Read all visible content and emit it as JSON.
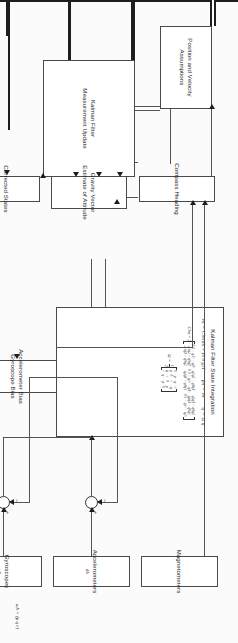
{
  "figure": {
    "type": "block-diagram",
    "orientation_note": "landscape figure printed rotated 90 degrees on a portrait page"
  },
  "blocks": {
    "position_velocity": {
      "line1": "Position and Velocity",
      "line2": "Assumptions"
    },
    "kf_measurement_update": {
      "line1": "Kalman Filter",
      "line2": "Measurement Update"
    },
    "compass_heading": {
      "line1": "Compass Heading"
    },
    "gravity_vector": {
      "line1": "Gravity Vector",
      "line2": "Estimate of Attitude"
    },
    "corrected_states": {
      "line1": "Corrected States"
    },
    "bias": {
      "line1": "Accelerometer Bias",
      "line2": "Gyroscope Bias"
    },
    "magnetometers": {
      "line1": "Magnetometers"
    },
    "accelerometers": {
      "line1": "Accelerometers",
      "symbol": "ãb"
    },
    "gyroscopes": {
      "line1": "Gyroscopes",
      "symbol": "ω̃b"
    },
    "state_integration": {
      "title": "Kalman Filter State Integration",
      "eq1_lhs": "v̇n",
      "eq1_rhs": "Cbn ãb + [0 0 g]T",
      "eq2_lhs": "ṗn",
      "eq2_rhs": "vn",
      "eq3_lhs": "q̇",
      "eq3_rhs": "Ω q",
      "dcm_label": "Cbn = 2",
      "dcm": [
        [
          "0.5 − q2² − q3²",
          "q1q2 − q0q3",
          "q1q3 + q0q2"
        ],
        [
          "q1q2 + q0q3",
          "0.5 − q1² − q3²",
          "q2q3 − q0q1"
        ],
        [
          "q1q3 − q0q2",
          "q2q3 + q0q1",
          "0.5 − q1² − q2²"
        ]
      ],
      "omega_label": "Ω =",
      "omega_coef_num": "1",
      "omega_coef_den": "2",
      "omega": [
        [
          "0",
          "−p",
          "−q",
          "−r"
        ],
        [
          "p",
          "0",
          "r",
          "−q"
        ],
        [
          "q",
          "−r",
          "0",
          "p"
        ],
        [
          "r",
          "q",
          "−p",
          "0"
        ]
      ]
    }
  },
  "annotations": {
    "gyro_components": "ω̃b = [p  q  r]",
    "sum_plus": "+",
    "sum_minus": "−"
  },
  "colors": {
    "paper": "#fbfbfb",
    "block_border": "#4a4a4a",
    "line_thin": "#545454",
    "line_bold": "#1d1d1d",
    "text": "#1a1a1a"
  }
}
